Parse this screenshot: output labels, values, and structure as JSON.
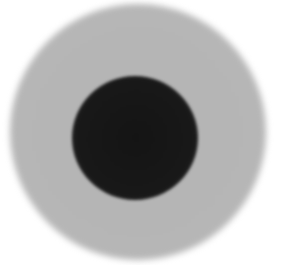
{
  "image": {
    "description": "Grayscale image of a blurred light-gray circular disk with a dark circular center on white background",
    "background_color": "#ffffff",
    "outer_disk": {
      "center": [
        138,
        132
      ],
      "radius": 128,
      "color": "#b5b5b5"
    },
    "inner_disk": {
      "center": [
        135,
        138
      ],
      "radius": 62,
      "color": "#161616"
    }
  }
}
